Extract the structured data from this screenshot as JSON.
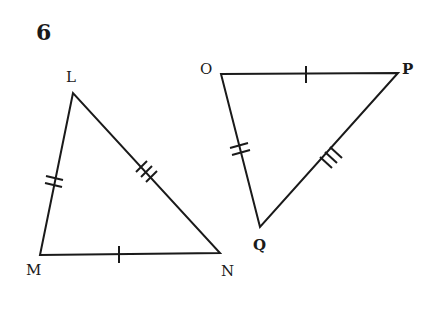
{
  "problem_number": "6",
  "triangles": [
    {
      "name": "LMN",
      "vertices": {
        "L": "L",
        "M": "M",
        "N": "N"
      },
      "tick_marks": {
        "LM": 2,
        "LN": 3,
        "MN": 1
      }
    },
    {
      "name": "OPQ",
      "vertices": {
        "O": "O",
        "P": "P",
        "Q": "Q"
      },
      "tick_marks": {
        "OQ": 2,
        "PQ": 3,
        "OP": 1
      }
    }
  ],
  "colors": {
    "stroke": "#1a1a1a",
    "background": "#ffffff"
  }
}
